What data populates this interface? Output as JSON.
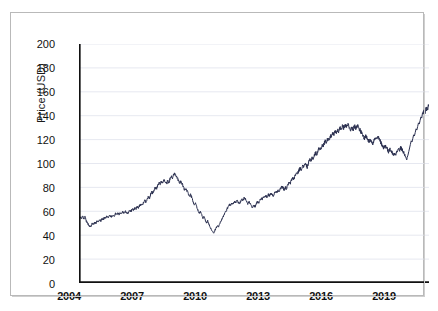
{
  "chart_data": {
    "type": "line",
    "title": "",
    "xlabel": "",
    "ylabel": "Price (USD)",
    "xlim": [
      2004.0,
      2021.3
    ],
    "ylim": [
      0,
      200
    ],
    "xticks": [
      2004,
      2007,
      2010,
      2013,
      2016,
      2019
    ],
    "xtick_labels": [
      "2004",
      "2007",
      "2010",
      "2013",
      "2016",
      "2019"
    ],
    "yticks": [
      0,
      20,
      40,
      60,
      80,
      100,
      120,
      140,
      160,
      180,
      200
    ],
    "ytick_labels": [
      "0",
      "20",
      "40",
      "60",
      "80",
      "100",
      "120",
      "140",
      "160",
      "180",
      "200"
    ],
    "grid": "horizontal",
    "grid_color": "#dfe2ec",
    "legend": "none",
    "line_color": "#2b3050",
    "line_width": 1.0,
    "series": [
      {
        "name": "Price (USD)",
        "x": [
          2004.0,
          2004.06,
          2004.12,
          2004.18,
          2004.24,
          2004.3,
          2004.36,
          2004.42,
          2004.48,
          2004.54,
          2004.6,
          2004.66,
          2004.72,
          2004.78,
          2004.84,
          2004.9,
          2004.96,
          2005.02,
          2005.08,
          2005.14,
          2005.2,
          2005.26,
          2005.32,
          2005.38,
          2005.44,
          2005.5,
          2005.56,
          2005.62,
          2005.68,
          2005.74,
          2005.8,
          2005.86,
          2005.92,
          2005.98,
          2006.04,
          2006.1,
          2006.16,
          2006.22,
          2006.28,
          2006.34,
          2006.4,
          2006.46,
          2006.52,
          2006.58,
          2006.64,
          2006.7,
          2006.76,
          2006.82,
          2006.88,
          2006.94,
          2007.0,
          2007.06,
          2007.12,
          2007.18,
          2007.24,
          2007.3,
          2007.36,
          2007.42,
          2007.48,
          2007.54,
          2007.6,
          2007.66,
          2007.72,
          2007.78,
          2007.84,
          2007.9,
          2007.96,
          2008.02,
          2008.08,
          2008.14,
          2008.2,
          2008.26,
          2008.32,
          2008.38,
          2008.44,
          2008.5,
          2008.56,
          2008.62,
          2008.68,
          2008.74,
          2008.8,
          2008.86,
          2008.92,
          2008.98,
          2009.04,
          2009.1,
          2009.16,
          2009.22,
          2009.28,
          2009.34,
          2009.4,
          2009.46,
          2009.52,
          2009.58,
          2009.64,
          2009.7,
          2009.76,
          2009.82,
          2009.88,
          2009.94,
          2010.0,
          2010.06,
          2010.12,
          2010.18,
          2010.24,
          2010.3,
          2010.36,
          2010.42,
          2010.48,
          2010.54,
          2010.6,
          2010.66,
          2010.72,
          2010.78,
          2010.84,
          2010.9,
          2010.96,
          2011.02,
          2011.08,
          2011.14,
          2011.2,
          2011.26,
          2011.32,
          2011.38,
          2011.44,
          2011.5,
          2011.56,
          2011.62,
          2011.68,
          2011.74,
          2011.8,
          2011.86,
          2011.92,
          2011.98,
          2012.04,
          2012.1,
          2012.16,
          2012.22,
          2012.28,
          2012.34,
          2012.4,
          2012.46,
          2012.52,
          2012.58,
          2012.64,
          2012.7,
          2012.76,
          2012.82,
          2012.88,
          2012.94,
          2013.0,
          2013.06,
          2013.12,
          2013.18,
          2013.24,
          2013.3,
          2013.36,
          2013.42,
          2013.48,
          2013.54,
          2013.6,
          2013.66,
          2013.72,
          2013.78,
          2013.84,
          2013.9,
          2013.96,
          2014.02,
          2014.08,
          2014.14,
          2014.2,
          2014.26,
          2014.32,
          2014.38,
          2014.44,
          2014.5,
          2014.56,
          2014.62,
          2014.68,
          2014.74,
          2014.8,
          2014.86,
          2014.92,
          2014.98,
          2015.04,
          2015.1,
          2015.16,
          2015.22,
          2015.28,
          2015.34,
          2015.4,
          2015.46,
          2015.52,
          2015.58,
          2015.64,
          2015.7,
          2015.76,
          2015.82,
          2015.88,
          2015.94,
          2016.0,
          2016.06,
          2016.12,
          2016.18,
          2016.24,
          2016.3,
          2016.36,
          2016.42,
          2016.48,
          2016.54,
          2016.6,
          2016.66,
          2016.72,
          2016.78,
          2016.84,
          2016.9,
          2016.96,
          2017.02,
          2017.08,
          2017.14,
          2017.2,
          2017.26,
          2017.32,
          2017.38,
          2017.44,
          2017.5,
          2017.56,
          2017.62,
          2017.68,
          2017.74,
          2017.8,
          2017.86,
          2017.92,
          2017.98,
          2018.04,
          2018.1,
          2018.16,
          2018.22,
          2018.28,
          2018.34,
          2018.4,
          2018.46,
          2018.52,
          2018.58,
          2018.64,
          2018.7,
          2018.76,
          2018.82,
          2018.88,
          2018.94,
          2019.0,
          2019.06,
          2019.12,
          2019.18,
          2019.24,
          2019.3,
          2019.36,
          2019.42,
          2019.48,
          2019.54,
          2019.6,
          2019.66,
          2019.72,
          2019.78,
          2019.84,
          2019.9,
          2019.96,
          2020.02,
          2020.08,
          2020.14,
          2020.18,
          2020.2,
          2020.22,
          2020.26,
          2020.3,
          2020.34,
          2020.38,
          2020.42,
          2020.46,
          2020.5,
          2020.54,
          2020.58,
          2020.62,
          2020.66,
          2020.7,
          2020.74,
          2020.78,
          2020.82,
          2020.86,
          2020.9,
          2020.94,
          2020.98,
          2021.04,
          2021.1,
          2021.16,
          2021.22,
          2021.28
        ],
        "y": [
          53.0,
          55.0,
          54.0,
          56.0,
          53.5,
          55.5,
          52.0,
          50.0,
          48.5,
          47.0,
          48.0,
          50.0,
          49.0,
          51.0,
          50.0,
          52.0,
          51.5,
          53.0,
          52.0,
          54.0,
          53.0,
          55.0,
          54.5,
          56.0,
          55.0,
          57.0,
          56.0,
          55.5,
          57.0,
          56.0,
          58.0,
          57.0,
          58.5,
          57.5,
          59.0,
          58.0,
          59.5,
          58.5,
          60.0,
          59.0,
          58.0,
          59.5,
          61.0,
          60.0,
          62.0,
          61.0,
          63.0,
          62.0,
          64.0,
          63.0,
          65.0,
          66.0,
          65.0,
          67.0,
          69.0,
          68.0,
          70.0,
          72.0,
          71.0,
          74.0,
          76.0,
          75.0,
          78.0,
          80.0,
          79.0,
          82.0,
          84.0,
          83.0,
          85.0,
          84.0,
          86.0,
          85.0,
          83.0,
          85.0,
          84.0,
          87.0,
          89.0,
          88.0,
          91.0,
          92.0,
          90.0,
          88.0,
          86.0,
          84.0,
          85.0,
          83.0,
          80.0,
          78.0,
          79.0,
          77.0,
          75.0,
          73.0,
          74.0,
          71.0,
          68.0,
          66.0,
          67.0,
          64.0,
          61.0,
          58.0,
          60.0,
          57.0,
          54.0,
          56.0,
          53.0,
          50.0,
          52.0,
          49.0,
          47.0,
          45.0,
          43.0,
          42.0,
          44.0,
          46.0,
          48.0,
          47.0,
          50.0,
          52.0,
          54.0,
          56.0,
          58.0,
          60.0,
          62.0,
          64.0,
          66.0,
          65.0,
          67.0,
          66.0,
          68.0,
          67.0,
          69.0,
          68.0,
          66.0,
          68.0,
          70.0,
          69.0,
          71.0,
          70.0,
          68.0,
          66.0,
          68.0,
          67.0,
          65.0,
          63.0,
          65.0,
          64.0,
          66.0,
          68.0,
          67.0,
          69.0,
          71.0,
          70.0,
          72.0,
          71.0,
          73.0,
          72.0,
          74.0,
          73.0,
          75.0,
          74.0,
          73.0,
          75.0,
          77.0,
          76.0,
          78.0,
          77.0,
          79.0,
          81.0,
          80.0,
          78.0,
          80.0,
          79.0,
          82.0,
          84.0,
          83.0,
          86.0,
          88.0,
          87.0,
          90.0,
          92.0,
          91.0,
          94.0,
          96.0,
          95.0,
          98.0,
          97.0,
          100.0,
          99.0,
          97.0,
          100.0,
          103.0,
          102.0,
          105.0,
          104.0,
          107.0,
          109.0,
          108.0,
          111.0,
          113.0,
          112.0,
          115.0,
          114.0,
          117.0,
          119.0,
          118.0,
          121.0,
          120.0,
          123.0,
          122.0,
          125.0,
          124.0,
          127.0,
          126.0,
          128.0,
          127.0,
          130.0,
          129.0,
          131.0,
          130.0,
          132.0,
          131.0,
          133.0,
          132.0,
          130.0,
          128.0,
          130.0,
          129.0,
          131.0,
          130.0,
          132.0,
          131.0,
          129.0,
          127.0,
          125.0,
          123.0,
          121.0,
          123.0,
          122.0,
          120.0,
          118.0,
          120.0,
          119.0,
          117.0,
          119.0,
          121.0,
          120.0,
          122.0,
          121.0,
          119.0,
          117.0,
          115.0,
          113.0,
          115.0,
          114.0,
          112.0,
          110.0,
          112.0,
          111.0,
          109.0,
          107.0,
          109.0,
          108.0,
          110.0,
          112.0,
          111.0,
          113.0,
          112.0,
          110.0,
          108.0,
          106.0,
          104.0,
          103.0,
          105.0,
          107.0,
          110.0,
          113.0,
          116.0,
          119.0,
          118.0,
          121.0,
          124.0,
          123.0,
          126.0,
          129.0,
          128.0,
          131.0,
          134.0,
          133.0,
          136.0,
          139.0,
          138.0,
          141.0,
          144.0,
          143.0,
          146.0,
          145.0,
          148.0
        ]
      }
    ]
  },
  "axes": {
    "ylabel": "Price (USD)",
    "ytick_labels": [
      "200",
      "180",
      "160",
      "140",
      "120",
      "100",
      "80",
      "60",
      "40",
      "20",
      "0"
    ],
    "xtick_labels": [
      "2004",
      "2007",
      "2010",
      "2013",
      "2016",
      "2019"
    ]
  }
}
